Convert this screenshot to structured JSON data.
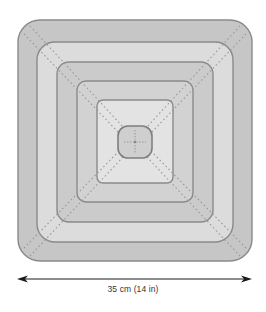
{
  "diagram": {
    "dimension_label": "35 cm (14 in)",
    "colors": {
      "band_dark": "#c4c4c4",
      "band_light": "#d9d9d9",
      "band_lighter": "#e2e2e2",
      "outline": "#8a8a8a",
      "dash": "#9a9a9a",
      "arrow": "#1a1a1a"
    },
    "rounds": [
      {
        "name": "round-1-outer",
        "x": 18,
        "y": 20,
        "w": 234,
        "h": 241,
        "r": 22,
        "fill": "#c6c6c6"
      },
      {
        "name": "round-2",
        "x": 37,
        "y": 42,
        "w": 196,
        "h": 200,
        "r": 18,
        "fill": "#dcdcdc"
      },
      {
        "name": "round-3",
        "x": 57,
        "y": 62,
        "w": 156,
        "h": 160,
        "r": 12,
        "fill": "#cbcbcb"
      },
      {
        "name": "round-4",
        "x": 77,
        "y": 81,
        "w": 116,
        "h": 121,
        "r": 9,
        "fill": "#d2d2d2"
      },
      {
        "name": "round-5",
        "x": 97,
        "y": 100,
        "w": 76,
        "h": 83,
        "r": 6,
        "fill": "#e3e3e3"
      },
      {
        "name": "center-motif",
        "x": 118,
        "y": 126,
        "w": 34,
        "h": 32,
        "r": 10,
        "fill": "#cfcfcf"
      }
    ]
  }
}
